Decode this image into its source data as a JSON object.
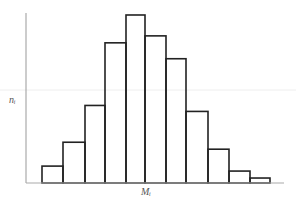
{
  "chart_data": {
    "type": "bar",
    "subtype": "histogram",
    "title": "",
    "xlabel": "M_i",
    "ylabel": "n_i",
    "xlabel_display": "Mᵢ",
    "ylabel_display": "nᵢ",
    "categories": [
      "1",
      "2",
      "3",
      "4",
      "5",
      "6",
      "7",
      "8",
      "9",
      "10",
      "11"
    ],
    "values": [
      17,
      41,
      78,
      141,
      169,
      148,
      125,
      72,
      34,
      12,
      5
    ],
    "ylim": [
      0,
      170
    ],
    "grid": false,
    "legend": null,
    "tick_labels": false,
    "bar_edges_px": [
      42,
      63,
      85,
      105,
      126,
      145,
      166,
      186,
      208,
      229,
      250,
      270
    ],
    "reference_line_y_px": 90
  },
  "colors": {
    "bar_stroke": "#222222",
    "axis": "#999999",
    "reference_line": "#eeeeee",
    "label": "#555555"
  }
}
